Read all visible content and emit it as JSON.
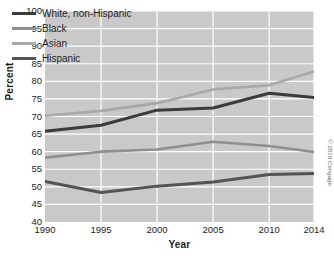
{
  "chart_data": {
    "type": "line",
    "title": "",
    "xlabel": "Year",
    "ylabel": "Percent",
    "x": [
      1990,
      1995,
      2000,
      2005,
      2010,
      2014
    ],
    "xticklabels": [
      "1990",
      "1995",
      "2000",
      "2005",
      "2010",
      "2014"
    ],
    "yticklabels": [
      "100",
      "95",
      "90",
      "85",
      "80",
      "75",
      "70",
      "65",
      "60",
      "55",
      "50",
      "45",
      "40"
    ],
    "yticks": [
      100,
      95,
      90,
      85,
      80,
      75,
      70,
      65,
      60,
      55,
      50,
      45,
      40
    ],
    "xlim": [
      1990,
      2014
    ],
    "ylim": [
      40,
      100
    ],
    "grid": true,
    "legend_position": "top-left",
    "plot_background": "#c9c9c9",
    "grid_color": "#ffffff",
    "series": [
      {
        "name": "White, non-Hispanic",
        "color": "#3b3b3b",
        "width": 3.0,
        "values": [
          65.8,
          67.5,
          71.8,
          72.4,
          76.6,
          75.4
        ]
      },
      {
        "name": "Black",
        "color": "#8f8f8f",
        "width": 2.6,
        "values": [
          58.3,
          60.0,
          60.6,
          62.8,
          61.6,
          59.9
        ]
      },
      {
        "name": "Asian",
        "color": "#a8a8a8",
        "width": 2.6,
        "values": [
          70.2,
          71.6,
          73.8,
          77.7,
          78.9,
          82.8
        ]
      },
      {
        "name": "Hispanic",
        "color": "#545454",
        "width": 3.0,
        "values": [
          51.5,
          48.4,
          50.2,
          51.4,
          53.5,
          53.8
        ]
      }
    ]
  },
  "credit": {
    "text": "© 2019 Cengage"
  }
}
